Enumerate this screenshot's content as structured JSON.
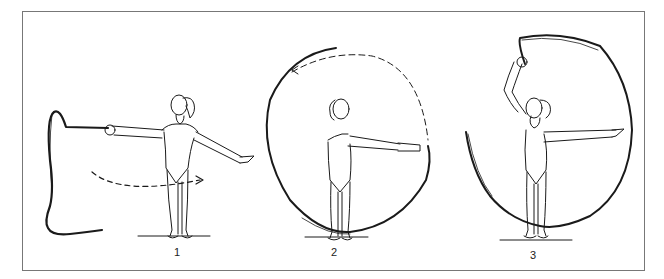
{
  "figure": {
    "panels": [
      {
        "label": "1",
        "description": "figure standing, arms extended sideways, ribbon held in left hand trailing on floor, dashed arrow indicating rotation"
      },
      {
        "label": "2",
        "description": "figure with arms forward, ribbon forming a full circle around body, dashed arc at top"
      },
      {
        "label": "3",
        "description": "figure with right arm raised, left arm extended, ribbon forming a large spiral around body"
      }
    ]
  },
  "colors": {
    "line": "#1a1a1a",
    "frame": "#777777",
    "background": "#ffffff"
  }
}
